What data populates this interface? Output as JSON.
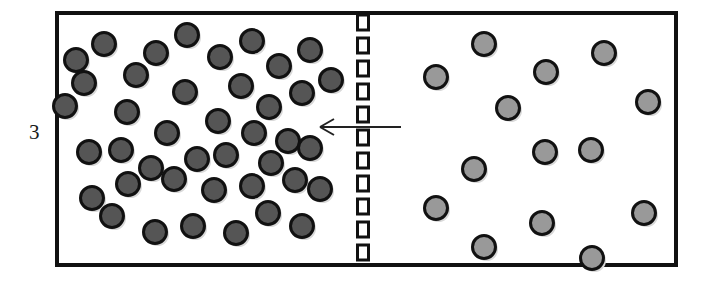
{
  "figure": {
    "label": "3"
  },
  "colors": {
    "outline": "#111111",
    "background": "#ffffff",
    "dark_particle_fill": "#555555",
    "light_particle_fill": "#999999",
    "particle_stroke": "#111111",
    "membrane": "#111111",
    "arrow": "#222222",
    "label_text": "#1a1a1a"
  },
  "container": {
    "name": "container-box",
    "x": 57,
    "y": 13,
    "width": 619,
    "height": 252,
    "stroke_width": 4
  },
  "membrane": {
    "name": "semi-permeable-membrane",
    "center_x": 363,
    "top": 15,
    "bottom": 263,
    "dash_width": 11,
    "dash_height": 15,
    "dash_gap": 8,
    "stroke_width": 3,
    "style": "dashed-rectangles"
  },
  "arrow": {
    "name": "flow-arrow",
    "direction": "left",
    "tail_x": 401,
    "head_x": 320,
    "y": 127,
    "stroke_width": 2,
    "head_length": 14,
    "head_spread": 8
  },
  "compartments": [
    {
      "name": "left-compartment",
      "side": "left",
      "particle_count": 41,
      "particle_shade": "dark",
      "concentration": "high"
    },
    {
      "name": "right-compartment",
      "side": "right",
      "particle_count": 21,
      "particle_shade": "light",
      "concentration": "low"
    }
  ],
  "chart_data": {
    "type": "scatter",
    "xlabel": "",
    "ylabel": "",
    "xlim": [
      57,
      676
    ],
    "ylim": [
      13,
      265
    ],
    "grid": false,
    "legend": "none",
    "annotations": [
      {
        "text": "3",
        "x": 33,
        "y": 133,
        "role": "figure-number"
      },
      {
        "text": "",
        "x": 363,
        "y": 139,
        "role": "membrane"
      },
      {
        "text": "",
        "x": 360,
        "y": 127,
        "role": "flow-arrow-left"
      }
    ],
    "series": [
      {
        "name": "dark particles (left, high concentration)",
        "shade": "dark",
        "fill": "#555555",
        "radius": 11.5,
        "points": [
          [
            104,
            44
          ],
          [
            76,
            60
          ],
          [
            156,
            53
          ],
          [
            187,
            35
          ],
          [
            220,
            57
          ],
          [
            252,
            41
          ],
          [
            279,
            66
          ],
          [
            136,
            75
          ],
          [
            310,
            50
          ],
          [
            331,
            80
          ],
          [
            84,
            83
          ],
          [
            185,
            92
          ],
          [
            241,
            86
          ],
          [
            269,
            107
          ],
          [
            302,
            93
          ],
          [
            127,
            112
          ],
          [
            167,
            133
          ],
          [
            218,
            121
          ],
          [
            254,
            133
          ],
          [
            288,
            141
          ],
          [
            89,
            152
          ],
          [
            121,
            150
          ],
          [
            151,
            168
          ],
          [
            197,
            159
          ],
          [
            226,
            155
          ],
          [
            271,
            163
          ],
          [
            310,
            148
          ],
          [
            128,
            184
          ],
          [
            174,
            179
          ],
          [
            214,
            190
          ],
          [
            92,
            198
          ],
          [
            252,
            186
          ],
          [
            295,
            180
          ],
          [
            320,
            189
          ],
          [
            112,
            216
          ],
          [
            155,
            232
          ],
          [
            193,
            226
          ],
          [
            236,
            233
          ],
          [
            268,
            213
          ],
          [
            302,
            226
          ],
          [
            65,
            106
          ]
        ]
      },
      {
        "name": "light particles (right, low concentration)",
        "shade": "light",
        "fill": "#999999",
        "radius": 11.5,
        "points": [
          [
            436,
            77
          ],
          [
            484,
            44
          ],
          [
            546,
            72
          ],
          [
            604,
            53
          ],
          [
            508,
            108
          ],
          [
            648,
            102
          ],
          [
            474,
            169
          ],
          [
            545,
            152
          ],
          [
            591,
            150
          ],
          [
            436,
            208
          ],
          [
            542,
            223
          ],
          [
            644,
            213
          ],
          [
            438,
            304
          ],
          [
            484,
            247
          ],
          [
            536,
            262
          ],
          [
            649,
            307
          ],
          [
            592,
            258
          ],
          [
            437,
            307
          ],
          [
            489,
            324
          ],
          [
            545,
            322
          ],
          [
            646,
            311
          ]
        ]
      }
    ]
  }
}
